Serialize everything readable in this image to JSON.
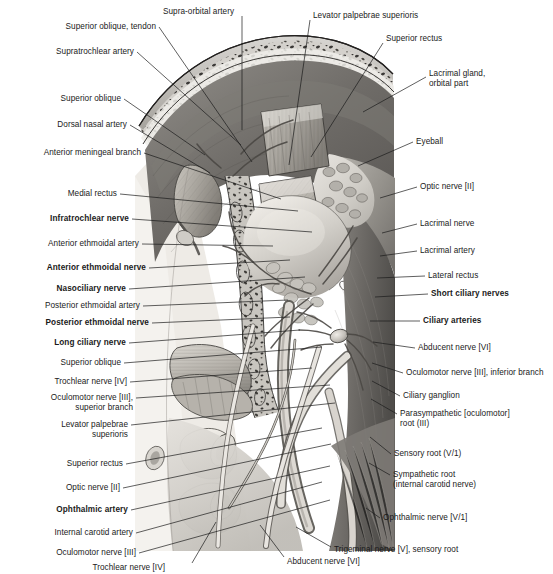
{
  "plate": {
    "title": "Orbit — superior view, deep dissection",
    "width": 553,
    "height": 574,
    "background": "#ffffff",
    "ink": "#1a1a1a",
    "illustration": {
      "name": "orbital-contents-superior-dissection",
      "style": "grayscale anatomical airbrush illustration",
      "region": {
        "x": 133,
        "y": 26,
        "width": 262,
        "height": 525
      }
    }
  },
  "labels": {
    "left": [
      {
        "id": "superior-oblique-tendon",
        "text": "Superior oblique, tendon",
        "bold": false,
        "x": 156,
        "y": 27,
        "tip_x": 252,
        "tip_y": 162
      },
      {
        "id": "supratrochlear-artery",
        "text": "Supratrochlear artery",
        "bold": false,
        "x": 134,
        "y": 52,
        "tip_x": 241,
        "tip_y": 145
      },
      {
        "id": "superior-oblique-1",
        "text": "Superior oblique",
        "bold": false,
        "x": 121,
        "y": 99,
        "tip_x": 205,
        "tip_y": 155
      },
      {
        "id": "dorsal-nasal-artery",
        "text": "Dorsal nasal artery",
        "bold": false,
        "x": 127,
        "y": 125,
        "tip_x": 210,
        "tip_y": 173
      },
      {
        "id": "anterior-meningeal-branch",
        "text": "Anterior meningeal branch",
        "bold": false,
        "x": 141,
        "y": 153,
        "tip_x": 281,
        "tip_y": 199
      },
      {
        "id": "medial-rectus",
        "text": "Medial rectus",
        "bold": false,
        "x": 117,
        "y": 194,
        "tip_x": 298,
        "tip_y": 211
      },
      {
        "id": "infratrochlear-nerve",
        "text": "Infratrochlear nerve",
        "bold": true,
        "x": 129,
        "y": 219,
        "tip_x": 312,
        "tip_y": 232
      },
      {
        "id": "anterior-ethmoidal-artery",
        "text": "Anterior ethmoidal artery",
        "bold": false,
        "x": 139,
        "y": 244,
        "tip_x": 273,
        "tip_y": 246
      },
      {
        "id": "anterior-ethmoidal-nerve",
        "text": "Anterior ethmoidal nerve",
        "bold": true,
        "x": 146,
        "y": 268,
        "tip_x": 290,
        "tip_y": 260
      },
      {
        "id": "nasociliary-nerve",
        "text": "Nasociliary nerve",
        "bold": true,
        "x": 126,
        "y": 289,
        "tip_x": 305,
        "tip_y": 277
      },
      {
        "id": "posterior-ethmoidal-artery",
        "text": "Posterior ethmoidal artery",
        "bold": false,
        "x": 140,
        "y": 306,
        "tip_x": 288,
        "tip_y": 300
      },
      {
        "id": "posterior-ethmoidal-nerve",
        "text": "Posterior ethmoidal nerve",
        "bold": true,
        "x": 149,
        "y": 323,
        "tip_x": 290,
        "tip_y": 317
      },
      {
        "id": "long-ciliary-nerve",
        "text": "Long ciliary nerve",
        "bold": true,
        "x": 126,
        "y": 343,
        "tip_x": 300,
        "tip_y": 330
      },
      {
        "id": "superior-oblique-2",
        "text": "Superior oblique",
        "bold": false,
        "x": 121,
        "y": 363,
        "tip_x": 322,
        "tip_y": 347
      },
      {
        "id": "trochlear-nerve-iv-1",
        "text": "Trochlear nerve [IV]",
        "bold": false,
        "x": 127,
        "y": 382,
        "tip_x": 312,
        "tip_y": 368
      },
      {
        "id": "oculomotor-nerve-iii-superior-branch",
        "text": "Oculomotor nerve [III],\nsuperior branch",
        "bold": false,
        "x": 133,
        "y": 403,
        "tip_x": 330,
        "tip_y": 385
      },
      {
        "id": "levator-palpebrae-superioris-left",
        "text": "Levator palpebrae\nsuperioris",
        "bold": false,
        "x": 128,
        "y": 430,
        "tip_x": 335,
        "tip_y": 403
      },
      {
        "id": "superior-rectus-left",
        "text": "Superior rectus",
        "bold": false,
        "x": 123,
        "y": 464,
        "tip_x": 322,
        "tip_y": 428
      },
      {
        "id": "optic-nerve-ii-left",
        "text": "Optic nerve [II]",
        "bold": false,
        "x": 120,
        "y": 488,
        "tip_x": 331,
        "tip_y": 444
      },
      {
        "id": "ophthalmic-artery",
        "text": "Ophthalmic artery",
        "bold": true,
        "x": 128,
        "y": 510,
        "tip_x": 330,
        "tip_y": 466
      },
      {
        "id": "internal-carotid-artery",
        "text": "Internal carotid artery",
        "bold": false,
        "x": 133,
        "y": 533,
        "tip_x": 322,
        "tip_y": 482
      },
      {
        "id": "oculomotor-nerve-iii-left",
        "text": "Oculomotor nerve [III]",
        "bold": false,
        "x": 136,
        "y": 553,
        "tip_x": 330,
        "tip_y": 500
      }
    ],
    "right": [
      {
        "id": "supra-orbital-artery",
        "text": "Supra-orbital artery",
        "bold": false,
        "x": 163,
        "y": 12,
        "tip_x": 241,
        "tip_y": 130,
        "anchor": "bottom"
      },
      {
        "id": "levator-palpebrae-superioris-right",
        "text": "Levator palpebrae superioris",
        "bold": false,
        "x": 313,
        "y": 16,
        "tip_x": 289,
        "tip_y": 165
      },
      {
        "id": "superior-rectus-right",
        "text": "Superior rectus",
        "bold": false,
        "x": 386,
        "y": 39,
        "tip_x": 311,
        "tip_y": 157
      },
      {
        "id": "lacrimal-gland-orbital-part",
        "text": "Lacrimal gland,\norbital part",
        "bold": false,
        "x": 429,
        "y": 79,
        "tip_x": 363,
        "tip_y": 112
      },
      {
        "id": "eyeball",
        "text": "Eyeball",
        "bold": false,
        "x": 416,
        "y": 142,
        "tip_x": 358,
        "tip_y": 166
      },
      {
        "id": "optic-nerve-ii-right",
        "text": "Optic nerve [II]",
        "bold": false,
        "x": 420,
        "y": 187,
        "tip_x": 380,
        "tip_y": 198
      },
      {
        "id": "lacrimal-nerve",
        "text": "Lacrimal nerve",
        "bold": false,
        "x": 420,
        "y": 224,
        "tip_x": 382,
        "tip_y": 233
      },
      {
        "id": "lacrimal-artery",
        "text": "Lacrimal artery",
        "bold": false,
        "x": 420,
        "y": 251,
        "tip_x": 380,
        "tip_y": 256
      },
      {
        "id": "lateral-rectus",
        "text": "Lateral rectus",
        "bold": false,
        "x": 428,
        "y": 276,
        "tip_x": 377,
        "tip_y": 278
      },
      {
        "id": "short-ciliary-nerves",
        "text": "Short ciliary nerves",
        "bold": true,
        "x": 431,
        "y": 294,
        "tip_x": 375,
        "tip_y": 297
      },
      {
        "id": "ciliary-arteries",
        "text": "Ciliary arteries",
        "bold": true,
        "x": 423,
        "y": 321,
        "tip_x": 370,
        "tip_y": 321
      },
      {
        "id": "abducent-nerve-vi-right",
        "text": "Abducent nerve [VI]",
        "bold": false,
        "x": 418,
        "y": 348,
        "tip_x": 373,
        "tip_y": 342
      },
      {
        "id": "oculomotor-nerve-iii-inferior-branch",
        "text": "Oculomotor nerve [III], inferior branch",
        "bold": false,
        "x": 406,
        "y": 373,
        "tip_x": 372,
        "tip_y": 363
      },
      {
        "id": "ciliary-ganglion",
        "text": "Ciliary ganglion",
        "bold": false,
        "x": 403,
        "y": 396,
        "tip_x": 372,
        "tip_y": 381
      },
      {
        "id": "parasympathetic-oculomotor-root",
        "text": "Parasympathetic [oculomotor]\nroot (III)",
        "bold": false,
        "x": 400,
        "y": 419,
        "tip_x": 371,
        "tip_y": 399
      },
      {
        "id": "sensory-root-v1",
        "text": "Sensory root (V/1)",
        "bold": false,
        "x": 394,
        "y": 454,
        "tip_x": 370,
        "tip_y": 437
      },
      {
        "id": "sympathetic-root-internal-carotid-nerve",
        "text": "Sympathetic root\n(internal carotid nerve)",
        "bold": false,
        "x": 393,
        "y": 480,
        "tip_x": 369,
        "tip_y": 463
      },
      {
        "id": "ophthalmic-nerve-v1",
        "text": "Ophthalmic nerve [V/1]",
        "bold": false,
        "x": 383,
        "y": 518,
        "tip_x": 366,
        "tip_y": 508
      },
      {
        "id": "trigeminal-nerve-v-sensory-root",
        "text": "Trigeminal nerve [V], sensory root",
        "bold": false,
        "x": 334,
        "y": 550,
        "tip_x": 296,
        "tip_y": 527
      }
    ],
    "bottom": [
      {
        "id": "trochlear-nerve-iv-bottom",
        "text": "Trochlear nerve [IV]",
        "bold": false,
        "x": 165,
        "y": 568,
        "tip_x": 216,
        "tip_y": 522
      },
      {
        "id": "abducent-nerve-vi-bottom",
        "text": "Abducent nerve [VI]",
        "bold": false,
        "x": 287,
        "y": 562,
        "tip_x": 260,
        "tip_y": 525
      }
    ]
  }
}
